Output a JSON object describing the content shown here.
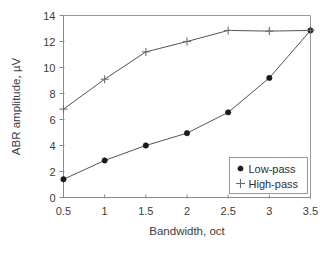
{
  "chart_data": {
    "type": "line",
    "title": "",
    "xlabel": "Bandwidth, oct",
    "ylabel": "ABR amplitude, µV",
    "x": [
      0.5,
      1,
      1.5,
      2,
      2.5,
      3,
      3.5
    ],
    "xlim": [
      0.5,
      3.5
    ],
    "ylim": [
      0,
      14
    ],
    "xticks": [
      "0.5",
      "1",
      "1.5",
      "2",
      "2.5",
      "3",
      "3.5"
    ],
    "yticks": [
      "0",
      "2",
      "4",
      "6",
      "8",
      "10",
      "12",
      "14"
    ],
    "grid": false,
    "legend_position": "lower-right",
    "series": [
      {
        "name": "Low-pass",
        "marker": "filled-circle",
        "values": [
          1.4,
          2.85,
          4.0,
          4.95,
          6.55,
          9.2,
          12.85
        ]
      },
      {
        "name": "High-pass",
        "marker": "plus",
        "values": [
          6.8,
          9.1,
          11.2,
          12.0,
          12.85,
          12.8,
          12.85
        ]
      }
    ]
  },
  "legend": {
    "entries": [
      {
        "label": "Low-pass",
        "marker": "filled-circle"
      },
      {
        "label": "High-pass",
        "marker": "plus"
      }
    ]
  },
  "axes": {
    "x_title": "Bandwidth, oct",
    "y_title": "ABR amplitude, µV"
  }
}
